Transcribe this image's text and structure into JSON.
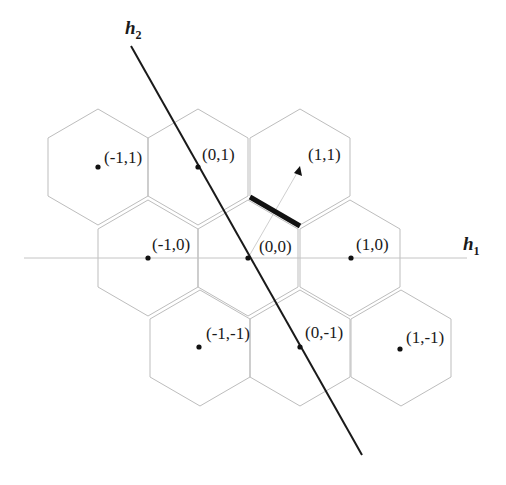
{
  "figure": {
    "type": "hexagonal-lattice-diagram",
    "axes": {
      "h1": {
        "label": "h",
        "subscript": "1"
      },
      "h2": {
        "label": "h",
        "subscript": "2"
      }
    },
    "cells": [
      {
        "id": "m1_1",
        "label": "(-1,1)"
      },
      {
        "id": "0_1",
        "label": "(0,1)"
      },
      {
        "id": "1_1",
        "label": "(1,1)"
      },
      {
        "id": "m1_0",
        "label": "(-1,0)"
      },
      {
        "id": "0_0",
        "label": "(0,0)"
      },
      {
        "id": "1_0",
        "label": "(1,0)"
      },
      {
        "id": "m1_m1",
        "label": "(-1,-1)"
      },
      {
        "id": "0_m1",
        "label": "(0,-1)"
      },
      {
        "id": "1_m1",
        "label": "(1,-1)"
      }
    ],
    "annotations": {
      "arrow": "vector from (0,0) toward (1,1)",
      "highlighted_edge": "shared boundary between cell (0,0) and cell (1,1)"
    },
    "colors": {
      "hex_stroke": "#bdbdbd",
      "h2_line": "#1a1a1a",
      "h1_line": "#c4c4c4",
      "highlight_edge": "#111111"
    }
  }
}
